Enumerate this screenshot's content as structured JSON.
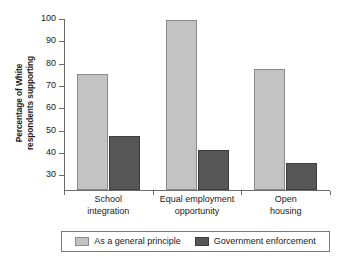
{
  "chart_data": {
    "type": "bar",
    "title": "",
    "xlabel": "",
    "ylabel": "Percentage of White respondents supporting",
    "ylabel_lines": [
      "Percentage of White",
      "respondents supporting"
    ],
    "categories": [
      "School integration",
      "Equal employment opportunity",
      "Open housing"
    ],
    "category_lines": [
      [
        "School",
        "integration"
      ],
      [
        "Equal employment",
        "opportunity"
      ],
      [
        "Open",
        "housing"
      ]
    ],
    "series": [
      {
        "name": "As a general principle",
        "values": [
          75,
          99,
          77
        ],
        "color": "#c3c3c3"
      },
      {
        "name": "Government enforcement",
        "values": [
          47,
          41,
          35
        ],
        "color": "#565656"
      }
    ],
    "ylim": [
      23,
      100
    ],
    "yticks": [
      30,
      40,
      50,
      60,
      70,
      80,
      90,
      100
    ],
    "ytick_labels": [
      "30",
      "40",
      "50",
      "60",
      "70",
      "80",
      "90",
      "100"
    ],
    "grid": false,
    "legend_position": "bottom"
  },
  "legend": {
    "items": [
      {
        "label": "As a general principle",
        "swatch": "light"
      },
      {
        "label": "Government enforcement",
        "swatch": "dark"
      }
    ]
  }
}
